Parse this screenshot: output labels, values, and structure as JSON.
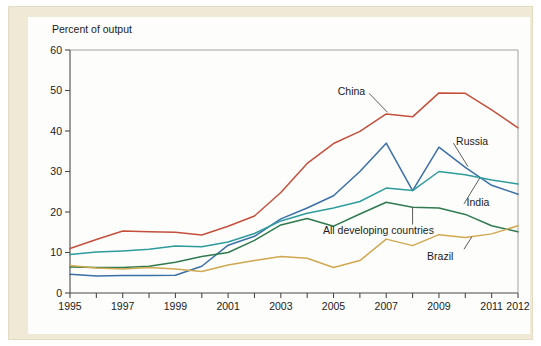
{
  "figure": {
    "axis_title": "Percent of output",
    "frame_color": "#efe9d6",
    "plate_color": "#fdfdfb",
    "axis_color": "#4a4a4a"
  },
  "chart_data": {
    "type": "line",
    "title": "",
    "subtitle": "",
    "xlabel": "",
    "ylabel": "Percent of output",
    "ylim": [
      0,
      60
    ],
    "xlim": [
      1995,
      2012
    ],
    "yticks": [
      0,
      10,
      20,
      30,
      40,
      50,
      60
    ],
    "ytick_labels": [
      "0",
      "10",
      "20",
      "30",
      "40",
      "50",
      "60"
    ],
    "xticks": [
      1995,
      1996,
      1997,
      1998,
      1999,
      2000,
      2001,
      2002,
      2003,
      2004,
      2005,
      2006,
      2007,
      2008,
      2009,
      2010,
      2011,
      2012
    ],
    "xtick_labels": [
      "1995",
      "",
      "1997",
      "",
      "1999",
      "",
      "2001",
      "",
      "2003",
      "",
      "2005",
      "",
      "2007",
      "",
      "2009",
      "",
      "2011",
      "2012"
    ],
    "grid": false,
    "legend": "inline-annotations",
    "x": [
      1995,
      1996,
      1997,
      1998,
      1999,
      2000,
      2001,
      2002,
      2003,
      2004,
      2005,
      2006,
      2007,
      2008,
      2009,
      2010,
      2011,
      2012
    ],
    "series": [
      {
        "name": "China",
        "color": "#c4503c",
        "label_x": 2006.2,
        "label_y": 50.0,
        "values": [
          11.0,
          13.2,
          15.3,
          15.1,
          15.0,
          14.3,
          16.5,
          19.0,
          24.8,
          32.0,
          36.9,
          39.9,
          44.2,
          43.5,
          49.4,
          49.3,
          45.2,
          40.8
        ]
      },
      {
        "name": "Russia",
        "color": "#3a6fa8",
        "label_x": 2009.6,
        "label_y": 38.2,
        "values": [
          4.6,
          4.2,
          4.3,
          4.3,
          4.4,
          6.6,
          11.8,
          14.0,
          18.3,
          21.0,
          24.0,
          30.0,
          37.0,
          25.3,
          36.0,
          31.0,
          26.6,
          24.4
        ]
      },
      {
        "name": "India",
        "color": "#2e9c9c",
        "label_x": 2009.9,
        "label_y": 22.8,
        "values": [
          9.5,
          10.1,
          10.4,
          10.8,
          11.6,
          11.4,
          12.6,
          14.7,
          17.8,
          19.7,
          21.0,
          22.6,
          25.9,
          25.3,
          30.0,
          29.2,
          27.9,
          26.9
        ]
      },
      {
        "name": "All developing countries",
        "color": "#2f7a4e",
        "label_x": 2005.5,
        "label_y": 16.2,
        "values": [
          6.4,
          6.3,
          6.3,
          6.6,
          7.6,
          9.0,
          10.0,
          13.0,
          16.8,
          18.4,
          16.5,
          19.5,
          22.4,
          21.2,
          21.0,
          19.4,
          16.6,
          15.1
        ]
      },
      {
        "name": "Brazil",
        "color": "#d0a84f",
        "label_x": 2009.5,
        "label_y": 9.6,
        "values": [
          6.8,
          6.2,
          5.9,
          6.3,
          5.9,
          5.3,
          6.9,
          8.0,
          9.0,
          8.6,
          6.3,
          8.0,
          13.3,
          11.7,
          14.4,
          13.7,
          14.6,
          16.6
        ]
      }
    ],
    "annotations": [
      {
        "text": "China",
        "target_x": 2007.0,
        "target_y": 44.2
      },
      {
        "text": "Russia",
        "target_x": 2010.0,
        "target_y": 31.0
      },
      {
        "text": "India",
        "target_x": 2010.6,
        "target_y": 28.6
      },
      {
        "text": "All developing countries",
        "target_x": 2008.0,
        "target_y": 21.2
      },
      {
        "text": "Brazil",
        "target_x": 2010.3,
        "target_y": 13.9
      }
    ]
  }
}
